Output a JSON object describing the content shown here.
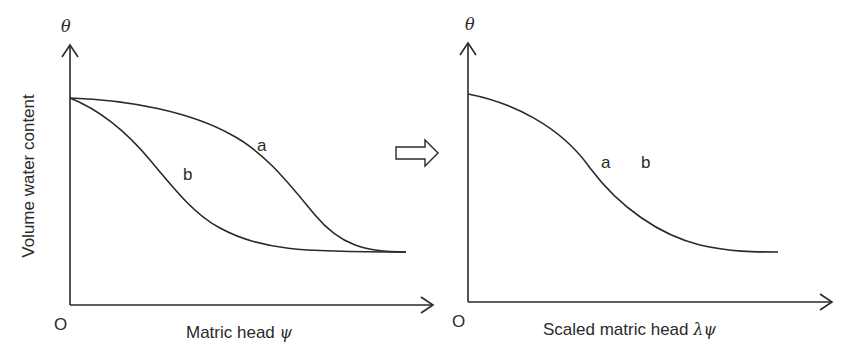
{
  "left_panel": {
    "y_axis_symbol": "θ",
    "y_axis_label": "Volume water content",
    "x_axis_label": "Matric head ",
    "x_axis_symbol": "ψ",
    "origin_label": "O",
    "curves": [
      {
        "id": "a",
        "label": "a"
      },
      {
        "id": "b",
        "label": "b"
      }
    ]
  },
  "transform_arrow": {
    "icon": "hollow-right-arrow-icon"
  },
  "right_panel": {
    "y_axis_symbol": "θ",
    "x_axis_label": "Scaled matric head ",
    "x_axis_symbol": "λψ",
    "origin_label": "O",
    "curve_labels": [
      "a",
      "b"
    ]
  },
  "colors": {
    "line": "#2a2a2a",
    "background": "#ffffff"
  }
}
